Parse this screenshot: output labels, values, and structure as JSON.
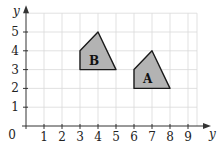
{
  "chart_data": {
    "type": "scatter",
    "title": "",
    "xlabel": "y",
    "ylabel": "y",
    "origin_label": "0",
    "x_ticks": [
      "1",
      "2",
      "3",
      "4",
      "5",
      "6",
      "7",
      "8",
      "9"
    ],
    "y_ticks": [
      "1",
      "2",
      "3",
      "4",
      "5"
    ],
    "xlim": [
      0,
      9.5
    ],
    "ylim": [
      0,
      6
    ],
    "grid": true,
    "shapes": [
      {
        "label": "A",
        "vertices": [
          [
            6,
            2
          ],
          [
            6,
            3
          ],
          [
            7,
            4
          ],
          [
            8,
            2
          ]
        ],
        "fill": "#b3b3b3",
        "stroke": "#1a1a1a"
      },
      {
        "label": "B",
        "vertices": [
          [
            3,
            3
          ],
          [
            3,
            4
          ],
          [
            4,
            5
          ],
          [
            5,
            3
          ]
        ],
        "fill": "#b3b3b3",
        "stroke": "#1a1a1a"
      }
    ]
  },
  "labels": {
    "x_axis": "y",
    "y_axis": "y",
    "origin": "0",
    "shape_a": "A",
    "shape_b": "B"
  },
  "colors": {
    "grid": "#d9d9d9",
    "axis": "#333333",
    "shape_fill": "#b3b3b3",
    "shape_stroke": "#1a1a1a"
  }
}
